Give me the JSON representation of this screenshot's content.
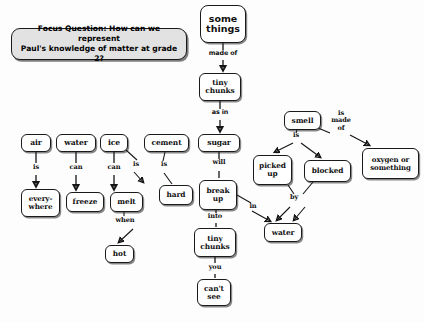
{
  "focus_question": {
    "name": "focus-question",
    "text": "Focus Question: How can we represent\nPaul's knowledge of matter at grade 2?",
    "fill_color": "#e2e2e2",
    "border_color": "#1a1a1a"
  },
  "colors": {
    "background": "#fdfdfd",
    "node_fill": "#ffffff",
    "node_border": "#1a1a1a",
    "text": "#111111",
    "shadow": "rgba(40,40,40,0.55)"
  },
  "nodes": [
    {
      "id": "some-things",
      "label": "some\nthings",
      "x": 200,
      "y": 5,
      "w": 46,
      "h": 38,
      "font": 9.5,
      "style": "big"
    },
    {
      "id": "tiny-chunks-1",
      "label": "tiny\nchunks",
      "x": 199,
      "y": 73,
      "w": 42,
      "h": 28,
      "font": 7.4,
      "style": "normal"
    },
    {
      "id": "sugar",
      "label": "sugar",
      "x": 198,
      "y": 134,
      "w": 42,
      "h": 18,
      "font": 7.6,
      "style": "normal"
    },
    {
      "id": "cement",
      "label": "cement",
      "x": 144,
      "y": 134,
      "w": 45,
      "h": 18,
      "font": 7.4,
      "style": "normal"
    },
    {
      "id": "ice",
      "label": "ice",
      "x": 100,
      "y": 134,
      "w": 28,
      "h": 18,
      "font": 7.6,
      "style": "normal"
    },
    {
      "id": "water-top",
      "label": "water",
      "x": 56,
      "y": 134,
      "w": 40,
      "h": 18,
      "font": 7.6,
      "style": "normal"
    },
    {
      "id": "air",
      "label": "air",
      "x": 21,
      "y": 134,
      "w": 30,
      "h": 18,
      "font": 7.6,
      "style": "normal"
    },
    {
      "id": "everywhere",
      "label": "every-\nwhere",
      "x": 21,
      "y": 189,
      "w": 39,
      "h": 28,
      "font": 7.2,
      "style": "normal"
    },
    {
      "id": "freeze",
      "label": "freeze",
      "x": 66,
      "y": 192,
      "w": 38,
      "h": 20,
      "font": 7.4,
      "style": "normal"
    },
    {
      "id": "melt",
      "label": "melt",
      "x": 110,
      "y": 192,
      "w": 33,
      "h": 20,
      "font": 7.4,
      "style": "normal"
    },
    {
      "id": "hard",
      "label": "hard",
      "x": 159,
      "y": 185,
      "w": 34,
      "h": 20,
      "font": 7.4,
      "style": "normal"
    },
    {
      "id": "break-up",
      "label": "break\nup",
      "x": 199,
      "y": 180,
      "w": 38,
      "h": 30,
      "font": 7.4,
      "style": "normal"
    },
    {
      "id": "hot",
      "label": "hot",
      "x": 105,
      "y": 245,
      "w": 29,
      "h": 18,
      "font": 7.4,
      "style": "normal"
    },
    {
      "id": "tiny-chunks-2",
      "label": "tiny\nchunks",
      "x": 194,
      "y": 228,
      "w": 42,
      "h": 29,
      "font": 7.4,
      "style": "normal"
    },
    {
      "id": "cant-see",
      "label": "can't\nsee",
      "x": 197,
      "y": 279,
      "w": 34,
      "h": 27,
      "font": 7.4,
      "style": "normal"
    },
    {
      "id": "smell",
      "label": "smell",
      "x": 284,
      "y": 111,
      "w": 37,
      "h": 19,
      "font": 7.4,
      "style": "normal"
    },
    {
      "id": "picked-up",
      "label": "picked\nup",
      "x": 253,
      "y": 155,
      "w": 39,
      "h": 30,
      "font": 7.4,
      "style": "normal"
    },
    {
      "id": "blocked",
      "label": "blocked",
      "x": 304,
      "y": 160,
      "w": 47,
      "h": 22,
      "font": 7.4,
      "style": "normal"
    },
    {
      "id": "oxygen",
      "label": "oxygen or\nsomething",
      "x": 362,
      "y": 148,
      "w": 57,
      "h": 31,
      "font": 7.0,
      "style": "normal"
    },
    {
      "id": "water-bottom",
      "label": "water",
      "x": 264,
      "y": 223,
      "w": 38,
      "h": 19,
      "font": 7.4,
      "style": "normal"
    }
  ],
  "link_labels": [
    {
      "id": "made-of",
      "text": "made of",
      "x": 201,
      "y": 53,
      "w": 44,
      "style": "sans"
    },
    {
      "id": "as-in",
      "text": "as in",
      "x": 204,
      "y": 111,
      "w": 32,
      "style": "sans"
    },
    {
      "id": "is-air",
      "text": "is",
      "x": 29,
      "y": 166,
      "w": 14,
      "style": "serif"
    },
    {
      "id": "can-water",
      "text": "can",
      "x": 66,
      "y": 166,
      "w": 22,
      "style": "serif"
    },
    {
      "id": "can-ice",
      "text": "can",
      "x": 104,
      "y": 166,
      "w": 22,
      "style": "serif"
    },
    {
      "id": "is-ice-hard",
      "text": "is",
      "x": 131,
      "y": 163,
      "w": 14,
      "style": "serif"
    },
    {
      "id": "is-cement",
      "text": "is",
      "x": 157,
      "y": 163,
      "w": 14,
      "style": "serif"
    },
    {
      "id": "will-sugar",
      "text": "will",
      "x": 208,
      "y": 161,
      "w": 22,
      "style": "serif"
    },
    {
      "id": "when-melt",
      "text": "when",
      "x": 111,
      "y": 218,
      "w": 30,
      "style": "serif"
    },
    {
      "id": "into",
      "text": "into",
      "x": 203,
      "y": 214,
      "w": 24,
      "style": "serif"
    },
    {
      "id": "you",
      "text": "you",
      "x": 204,
      "y": 265,
      "w": 22,
      "style": "serif"
    },
    {
      "id": "in",
      "text": "in",
      "x": 247,
      "y": 205,
      "w": 14,
      "style": "serif"
    },
    {
      "id": "is-smell",
      "text": "is",
      "x": 290,
      "y": 134,
      "w": 14,
      "style": "serif"
    },
    {
      "id": "is-made-of",
      "text": "is\nmade\nof",
      "x": 330,
      "y": 112,
      "w": 24,
      "style": "serif"
    },
    {
      "id": "by",
      "text": "by",
      "x": 288,
      "y": 196,
      "w": 14,
      "style": "serif"
    }
  ],
  "connectors": [
    {
      "id": "some-things-to-tiny-chunks",
      "from": "some-things",
      "to": "tiny-chunks-1",
      "arrow": true
    },
    {
      "id": "tiny-chunks-to-sugar",
      "from": "tiny-chunks-1",
      "to": "sugar",
      "arrow": true
    },
    {
      "id": "air-to-everywhere",
      "from": "air",
      "to": "everywhere",
      "arrow": true
    },
    {
      "id": "water-to-freeze",
      "from": "water-top",
      "to": "freeze",
      "arrow": true
    },
    {
      "id": "ice-to-melt",
      "from": "ice",
      "to": "melt",
      "arrow": true
    },
    {
      "id": "ice-to-hard",
      "from": "ice",
      "to": "hard",
      "arrow": true
    },
    {
      "id": "cement-to-hard",
      "from": "cement",
      "to": "hard",
      "arrow": false
    },
    {
      "id": "sugar-to-break-up",
      "from": "sugar",
      "to": "break-up",
      "arrow": true
    },
    {
      "id": "melt-to-hot",
      "from": "melt",
      "to": "hot",
      "arrow": true
    },
    {
      "id": "break-up-to-tiny-chunks",
      "from": "break-up",
      "to": "tiny-chunks-2",
      "arrow": false
    },
    {
      "id": "break-up-to-water",
      "from": "break-up",
      "to": "water-bottom",
      "arrow": true
    },
    {
      "id": "tiny-chunks-to-cant-see",
      "from": "tiny-chunks-2",
      "to": "cant-see",
      "arrow": false
    },
    {
      "id": "smell-to-picked-up",
      "from": "smell",
      "to": "picked-up",
      "arrow": true
    },
    {
      "id": "smell-to-blocked",
      "from": "smell",
      "to": "blocked",
      "arrow": true
    },
    {
      "id": "smell-to-oxygen",
      "from": "smell",
      "to": "oxygen",
      "arrow": true
    },
    {
      "id": "picked-up-to-water",
      "from": "picked-up",
      "to": "water-bottom",
      "arrow": true
    },
    {
      "id": "blocked-to-water",
      "from": "blocked",
      "to": "water-bottom",
      "arrow": true
    }
  ]
}
